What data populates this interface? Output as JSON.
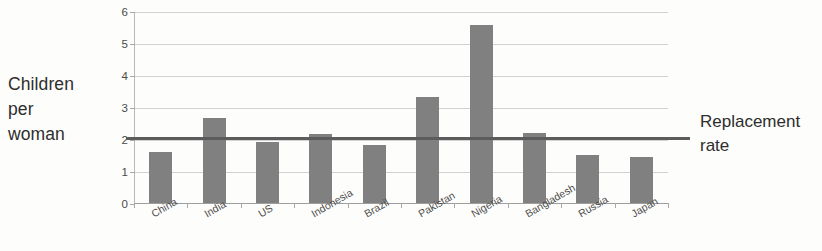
{
  "chart_data": {
    "type": "bar",
    "title": "",
    "xlabel": "",
    "ylabel": "Children per woman",
    "ylim": [
      0,
      6
    ],
    "yticks": [
      0,
      1,
      2,
      3,
      4,
      5,
      6
    ],
    "grid": true,
    "legend": "none",
    "bar_color": "#808080",
    "categories": [
      "China",
      "India",
      "US",
      "Indonesia",
      "Brazil",
      "Pakistan",
      "Nigeria",
      "Bangladesh",
      "Russia",
      "Japan"
    ],
    "values": [
      1.6,
      2.65,
      1.9,
      2.15,
      1.8,
      3.3,
      5.55,
      2.2,
      1.5,
      1.45
    ],
    "annotations": [
      {
        "name": "replacement-rate-line",
        "label": "Replacement rate",
        "value": 2.1,
        "orientation": "horizontal",
        "color": "#5c5c5c"
      }
    ]
  },
  "y_axis": {
    "title_lines": [
      "Children",
      "per",
      "woman"
    ]
  },
  "right_annotation": {
    "line1": "Replacement",
    "line2": "rate"
  }
}
